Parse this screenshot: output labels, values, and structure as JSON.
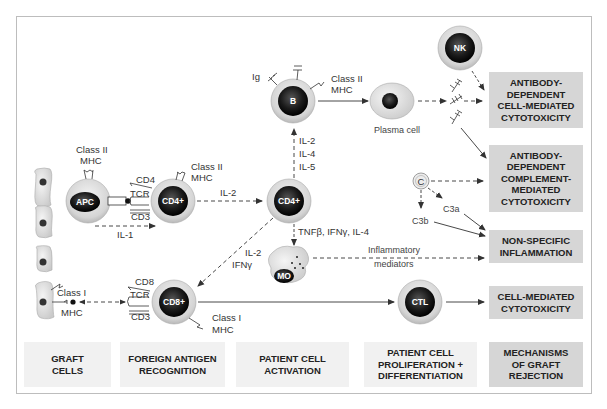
{
  "diagram": {
    "title": "Mechanisms of graft rejection",
    "colors": {
      "frame_border": "#bdbdbd",
      "outcome_box": "#d6d6d6",
      "stage_box": "#f1f1f1",
      "cell_dark": "#1a1a1a",
      "cell_halo": "#d9d9d9",
      "arrow": "#333333"
    },
    "cells": {
      "apc": "APC",
      "cd4_first": "CD4+",
      "cd4_second": "CD4+",
      "cd8": "CD8+",
      "b_cell": "B",
      "nk": "NK",
      "macrophage": "MO",
      "ctl": "CTL",
      "complement": "C",
      "plasma_cell": "Plasma cell"
    },
    "labels": {
      "apc_class2": "Class II",
      "apc_mhc": "MHC",
      "cd4_class2": "Class II",
      "cd4_mhc": "MHC",
      "cd4": "CD4",
      "tcr1": "TCR",
      "cd3_1": "CD3",
      "il1": "IL-1",
      "il2_a": "IL-2",
      "il2_b": "IL-2",
      "il4": "IL-4",
      "il5": "IL-5",
      "ig": "Ig",
      "b_class2": "Class II",
      "b_mhc": "MHC",
      "tnf": "TNFβ, IFNγ, IL-4",
      "il2_c": "IL-2",
      "ifng": "IFNγ",
      "inflam1": "Inflammatory",
      "inflam2": "mediators",
      "graft_class1": "Class I",
      "graft_mhc": "MHC",
      "cd8": "CD8",
      "tcr2": "TCR",
      "cd3_2": "CD3",
      "cd8_class1": "Class I",
      "cd8_mhc": "MHC",
      "c3a": "C3a",
      "c3b": "C3b"
    },
    "outcomes": [
      "ANTIBODY-\nDEPENDENT\nCELL-MEDIATED\nCYTOTOXICITY",
      "ANTIBODY-\nDEPENDENT\nCOMPLEMENT-\nMEDIATED\nCYTOTOXICITY",
      "NON-SPECIFIC\nINFLAMMATION",
      "CELL-MEDIATED\nCYTOTOXICITY"
    ],
    "stages": [
      "GRAFT\nCELLS",
      "FOREIGN ANTIGEN\nRECOGNITION",
      "PATIENT CELL\nACTIVATION",
      "PATIENT CELL\nPROLIFERATION +\nDIFFERENTIATION",
      "MECHANISMS\nOF GRAFT\nREJECTION"
    ]
  }
}
